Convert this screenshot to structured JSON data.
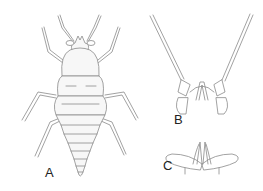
{
  "figure": {
    "panels": [
      {
        "id": "A",
        "label": "A",
        "content": "whole insect, dorsal view"
      },
      {
        "id": "B",
        "label": "B",
        "content": "head appendages / antennae detail"
      },
      {
        "id": "C",
        "label": "C",
        "content": "mouthpart detail"
      }
    ],
    "line_color": "#8a8a8a",
    "background": "#ffffff"
  }
}
